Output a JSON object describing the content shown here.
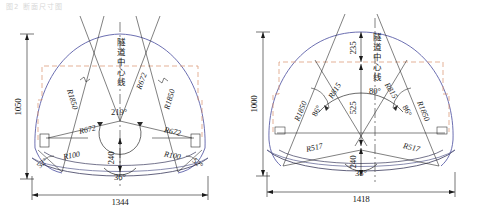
{
  "page": {
    "header_faint": "图2 断面尺寸图",
    "width": 482,
    "height": 212
  },
  "colors": {
    "outline": "#5b5fa8",
    "construction": "#2b2b2b",
    "dashed_accent": "#d98f6a",
    "centerline": "#4a4a4a",
    "dimension": "#1a1a1a",
    "inner_arc": "#6b6f9c"
  },
  "drawings": [
    {
      "id": "left",
      "name": "tunnel-section-left",
      "centerline_label": "隧道中心线",
      "dimensions": {
        "height": "1050",
        "width": "1344",
        "invert_rise": "240"
      },
      "angles": {
        "crown": "219°",
        "invert": "36°",
        "corner_left": "52°",
        "corner_right": "52°"
      },
      "radii": {
        "arch_left": "R1850",
        "arch_right": "R1850",
        "side_left": "R672",
        "side_right": "R672",
        "spring_left": "R672",
        "spring_right": "R672",
        "fillet_left": "R100",
        "fillet_right": "R100"
      }
    },
    {
      "id": "right",
      "name": "tunnel-section-right",
      "centerline_label": "隧道中心线",
      "dimensions": {
        "height": "1000",
        "width": "1418",
        "crown_offset": "235",
        "mid_rise": "525",
        "invert_rise": "240"
      },
      "angles": {
        "crown": "80°",
        "invert": "38°",
        "side_left": "86°",
        "side_right": "86°"
      },
      "radii": {
        "arch_left": "R1850",
        "arch_right": "R1850",
        "mid_left": "R815",
        "mid_right": "R815",
        "lower_left": "R517",
        "lower_right": "R517"
      }
    }
  ]
}
